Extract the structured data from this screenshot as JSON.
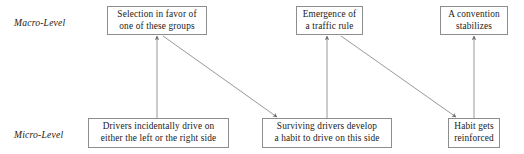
{
  "diagram": {
    "type": "two-level causal diagram",
    "width": 524,
    "height": 154,
    "background_color": "#ffffff",
    "line_color": "#8d8d8d",
    "text_color": "#1a1a1a"
  },
  "levels": [
    {
      "id": "macro",
      "label": "Macro-Level",
      "x": 14,
      "y": 17
    },
    {
      "id": "micro",
      "label": "Micro-Level",
      "x": 14,
      "y": 129
    }
  ],
  "nodes": [
    {
      "id": "selection",
      "level": "macro",
      "lines": [
        "Selection in favor of",
        "one of these groups"
      ],
      "x": 107,
      "y": 6,
      "w": 100,
      "h": 29
    },
    {
      "id": "emergence",
      "level": "macro",
      "lines": [
        "Emergence of",
        "a traffic rule"
      ],
      "x": 296,
      "y": 6,
      "w": 67,
      "h": 29
    },
    {
      "id": "convention",
      "level": "macro",
      "lines": [
        "A convention",
        "stabilizes"
      ],
      "x": 440,
      "y": 6,
      "w": 68,
      "h": 29
    },
    {
      "id": "drivers",
      "level": "micro",
      "lines": [
        "Drivers incidentally drive on",
        "either the left or the right side"
      ],
      "x": 88,
      "y": 118,
      "w": 141,
      "h": 30
    },
    {
      "id": "surviving",
      "level": "micro",
      "lines": [
        "Surviving drivers develop",
        "a habit to drive on this side"
      ],
      "x": 262,
      "y": 118,
      "w": 130,
      "h": 30
    },
    {
      "id": "habit",
      "level": "micro",
      "lines": [
        "Habit gets",
        "reinforced"
      ],
      "x": 448,
      "y": 118,
      "w": 52,
      "h": 30
    }
  ],
  "edges": [
    {
      "id": "drivers-to-selection",
      "from": "drivers",
      "to": "selection",
      "kind": "vertical",
      "x1": 157,
      "y1": 118,
      "x2": 157,
      "y2": 36
    },
    {
      "id": "selection-to-surviving",
      "from": "selection",
      "to": "surviving",
      "kind": "diagonal",
      "x1": 163,
      "y1": 36,
      "x2": 277,
      "y2": 117
    },
    {
      "id": "surviving-to-emergence",
      "from": "surviving",
      "to": "emergence",
      "kind": "vertical",
      "x1": 327,
      "y1": 118,
      "x2": 327,
      "y2": 36
    },
    {
      "id": "emergence-to-habit",
      "from": "emergence",
      "to": "habit",
      "kind": "diagonal",
      "x1": 341,
      "y1": 36,
      "x2": 456,
      "y2": 117
    },
    {
      "id": "habit-to-convention",
      "from": "habit",
      "to": "convention",
      "kind": "vertical",
      "x1": 474,
      "y1": 118,
      "x2": 474,
      "y2": 36
    }
  ]
}
